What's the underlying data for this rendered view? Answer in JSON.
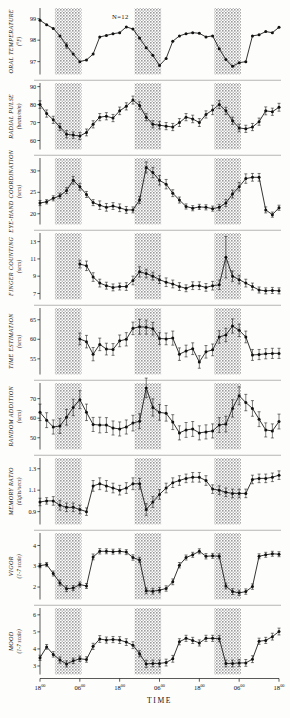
{
  "figure": {
    "annotation": "N=12",
    "x_axis_title": "TIME",
    "x_tick_labels": [
      "18",
      "06",
      "18",
      "06",
      "18",
      "06",
      "18"
    ],
    "x_tick_sup": "00",
    "x_tick_hours": [
      18,
      30,
      42,
      54,
      66,
      78,
      90
    ],
    "shaded_label": "sleep period",
    "shaded_color": "#c9c9c9",
    "line_color": "#111111"
  },
  "chart_data": [
    {
      "type": "line",
      "panel": 1,
      "title": "ORAL TEMPERATURE",
      "ylabel": "ORAL TEMPERATURE",
      "yunit": "(°F)",
      "xlabel": "TIME",
      "ylim": [
        96.4,
        99.5
      ],
      "yticks": [
        97,
        98,
        99
      ],
      "ytick_labels": [
        "97",
        "98",
        "99"
      ],
      "grid": false,
      "x": [
        18,
        20,
        22,
        24,
        26,
        28,
        30,
        32,
        34,
        36,
        38,
        40,
        42,
        44,
        46,
        48,
        50,
        52,
        54,
        56,
        58,
        60,
        62,
        64,
        66,
        68,
        70,
        72,
        74,
        76,
        78,
        80,
        82,
        84,
        86,
        88,
        90
      ],
      "values": [
        98.93,
        98.72,
        98.55,
        98.2,
        97.75,
        97.35,
        97.0,
        97.08,
        97.35,
        98.15,
        98.22,
        98.3,
        98.35,
        98.62,
        98.52,
        98.1,
        97.65,
        97.3,
        96.82,
        97.15,
        97.95,
        98.2,
        98.3,
        98.35,
        98.32,
        98.15,
        98.2,
        97.6,
        97.1,
        96.78,
        96.95,
        97.0,
        98.2,
        98.25,
        98.4,
        98.35,
        98.6
      ],
      "errors": [
        0,
        0,
        0,
        0,
        0.12,
        0,
        0,
        0,
        0,
        0,
        0,
        0,
        0,
        0,
        0,
        0,
        0,
        0,
        0,
        0,
        0,
        0,
        0,
        0,
        0,
        0,
        0,
        0,
        0,
        0,
        0,
        0,
        0,
        0,
        0,
        0,
        0
      ]
    },
    {
      "type": "line",
      "panel": 2,
      "title": "RADIAL PULSE",
      "ylabel": "RADIAL PULSE",
      "yunit": "(beats/min)",
      "xlabel": "TIME",
      "ylim": [
        55,
        92
      ],
      "yticks": [
        60,
        70,
        80,
        90
      ],
      "ytick_labels": [
        "60",
        "70",
        "80",
        "90"
      ],
      "grid": false,
      "x": [
        18,
        20,
        22,
        24,
        26,
        28,
        30,
        32,
        34,
        36,
        38,
        40,
        42,
        44,
        46,
        48,
        50,
        52,
        54,
        56,
        58,
        60,
        62,
        64,
        66,
        68,
        70,
        72,
        74,
        76,
        78,
        80,
        82,
        84,
        86,
        88,
        90
      ],
      "values": [
        80.0,
        75.0,
        71.5,
        67.5,
        63.5,
        63.0,
        62.5,
        64.5,
        69.0,
        73.0,
        73.5,
        72.5,
        76.5,
        79.0,
        82.5,
        79.5,
        73.0,
        69.0,
        68.5,
        68.0,
        67.5,
        70.0,
        73.0,
        72.0,
        70.0,
        74.5,
        77.0,
        80.0,
        76.5,
        71.0,
        67.0,
        66.5,
        67.5,
        70.5,
        76.5,
        76.0,
        78.5
      ],
      "errors": [
        2.1,
        2.0,
        2.0,
        2.0,
        2.0,
        1.8,
        2.0,
        1.9,
        2.0,
        2.0,
        2.0,
        2.0,
        2.1,
        2.0,
        2.2,
        2.1,
        2.0,
        2.0,
        2.0,
        2.0,
        2.0,
        2.2,
        2.0,
        2.1,
        2.2,
        2.0,
        2.6,
        2.2,
        2.0,
        2.0,
        2.1,
        2.0,
        2.0,
        2.0,
        2.2,
        2.0,
        2.2
      ]
    },
    {
      "type": "line",
      "panel": 3,
      "title": "EYE-HAND COORDINATION",
      "ylabel": "EYE-HAND COORDINATION",
      "yunit": "(secs)",
      "xlabel": "TIME",
      "ylim": [
        17.5,
        33
      ],
      "yticks": [
        20,
        25,
        30
      ],
      "ytick_labels": [
        "20",
        "25",
        "30"
      ],
      "grid": false,
      "x": [
        18,
        20,
        22,
        24,
        26,
        28,
        30,
        32,
        34,
        36,
        38,
        40,
        42,
        44,
        46,
        48,
        50,
        52,
        54,
        56,
        58,
        60,
        62,
        64,
        66,
        68,
        70,
        72,
        74,
        76,
        78,
        80,
        82,
        84,
        86,
        88,
        90
      ],
      "values": [
        22.5,
        22.8,
        23.6,
        24.2,
        25.4,
        27.8,
        26.3,
        24.5,
        22.6,
        22.0,
        21.5,
        21.8,
        21.4,
        20.9,
        20.9,
        23.2,
        30.8,
        29.6,
        27.8,
        26.9,
        24.8,
        23.2,
        21.7,
        21.3,
        21.6,
        21.5,
        21.2,
        21.5,
        22.5,
        24.6,
        26.3,
        28.2,
        28.5,
        28.5,
        20.9,
        19.8,
        21.4
      ],
      "errors": [
        0.6,
        0.5,
        0.6,
        0.6,
        0.7,
        0.9,
        0.8,
        0.7,
        0.7,
        1.0,
        0.9,
        0.8,
        0.9,
        0.8,
        0.7,
        0.8,
        1.3,
        1.2,
        1.1,
        1.1,
        0.8,
        0.7,
        0.6,
        0.6,
        0.6,
        0.6,
        0.6,
        0.7,
        0.8,
        0.9,
        1.0,
        1.1,
        0.9,
        0.9,
        0.7,
        0.6,
        0.6
      ]
    },
    {
      "type": "line",
      "panel": 4,
      "title": "FINGER COUNTING",
      "ylabel": "FINGER COUNTING",
      "yunit": "(secs)",
      "xlabel": "TIME",
      "ylim": [
        6.3,
        14
      ],
      "yticks": [
        7,
        9,
        11,
        13
      ],
      "ytick_labels": [
        "7",
        "9",
        "11",
        "13"
      ],
      "grid": false,
      "x": [
        30,
        32,
        34,
        36,
        38,
        40,
        42,
        44,
        46,
        48,
        50,
        52,
        54,
        56,
        58,
        60,
        62,
        64,
        66,
        68,
        70,
        72,
        74,
        76,
        78,
        80,
        82,
        84,
        86,
        88,
        90
      ],
      "values": [
        10.4,
        10.2,
        8.9,
        8.2,
        7.9,
        7.7,
        7.8,
        7.8,
        8.5,
        9.5,
        9.3,
        9.0,
        8.6,
        8.3,
        8.1,
        7.8,
        7.6,
        7.9,
        7.9,
        7.7,
        7.9,
        8.0,
        11.2,
        9.0,
        8.6,
        8.2,
        7.8,
        7.4,
        7.3,
        7.35,
        7.3
      ],
      "errors": [
        0.45,
        0.55,
        0.5,
        0.45,
        0.4,
        0.4,
        0.4,
        0.45,
        0.5,
        0.6,
        0.5,
        0.45,
        0.45,
        0.5,
        0.45,
        0.45,
        0.4,
        0.45,
        0.45,
        0.45,
        0.5,
        0.55,
        2.4,
        0.6,
        0.5,
        0.45,
        0.4,
        0.35,
        0.35,
        0.35,
        0.35
      ]
    },
    {
      "type": "line",
      "panel": 5,
      "title": "TIME ESTIMATION",
      "ylabel": "TIME ESTIMATION",
      "yunit": "(secs)",
      "xlabel": "TIME",
      "ylim": [
        51,
        68
      ],
      "yticks": [
        55,
        60,
        65
      ],
      "ytick_labels": [
        "55",
        "60",
        "65"
      ],
      "grid": false,
      "x": [
        30,
        32,
        34,
        36,
        38,
        40,
        42,
        44,
        46,
        48,
        50,
        52,
        54,
        56,
        58,
        60,
        62,
        64,
        66,
        68,
        70,
        72,
        74,
        76,
        78,
        80,
        82,
        84,
        86,
        88,
        90
      ],
      "values": [
        60.1,
        59.4,
        56.2,
        58.7,
        57.5,
        57.4,
        59.6,
        60.0,
        62.8,
        63.2,
        63.1,
        62.7,
        60.2,
        60.1,
        60.3,
        56.2,
        57.0,
        57.6,
        54.2,
        56.8,
        57.3,
        60.6,
        61.1,
        63.4,
        62.3,
        60.6,
        56.0,
        56.1,
        56.3,
        56.4,
        56.4
      ],
      "errors": [
        1.5,
        1.6,
        1.7,
        1.6,
        1.5,
        1.5,
        1.5,
        1.7,
        1.6,
        1.9,
        1.8,
        1.6,
        1.5,
        1.5,
        1.8,
        1.6,
        1.5,
        1.5,
        1.6,
        1.6,
        1.5,
        1.6,
        1.7,
        1.8,
        1.6,
        1.5,
        1.4,
        1.3,
        1.3,
        1.3,
        1.3
      ]
    },
    {
      "type": "line",
      "panel": 6,
      "title": "RANDOM ADDITION",
      "ylabel": "RANDOM ADDITION",
      "yunit": "(secs)",
      "xlabel": "TIME",
      "ylim": [
        44,
        78
      ],
      "yticks": [
        50,
        60,
        70
      ],
      "ytick_labels": [
        "50",
        "60",
        "70"
      ],
      "grid": false,
      "x": [
        18,
        20,
        22,
        24,
        26,
        28,
        30,
        32,
        34,
        36,
        38,
        40,
        42,
        44,
        46,
        48,
        50,
        52,
        54,
        56,
        58,
        60,
        62,
        64,
        66,
        68,
        70,
        72,
        74,
        76,
        78,
        80,
        82,
        84,
        86,
        88,
        90
      ],
      "values": [
        63.0,
        59.0,
        55.5,
        56.0,
        60.5,
        65.5,
        69.5,
        63.0,
        56.8,
        56.5,
        56.5,
        55.0,
        54.5,
        55.5,
        57.5,
        58.5,
        75.5,
        65.5,
        63.0,
        62.5,
        58.0,
        52.5,
        54.0,
        54.5,
        52.5,
        53.0,
        53.5,
        56.5,
        57.0,
        65.0,
        71.5,
        68.0,
        65.0,
        59.5,
        54.0,
        53.5,
        58.3
      ],
      "errors": [
        4.2,
        3.8,
        3.6,
        3.8,
        4.0,
        4.2,
        4.6,
        4.2,
        3.6,
        4.0,
        3.8,
        3.6,
        3.6,
        3.6,
        4.0,
        3.8,
        5.0,
        4.4,
        4.0,
        4.0,
        3.8,
        3.6,
        3.8,
        3.8,
        3.6,
        3.6,
        3.6,
        3.8,
        4.0,
        4.4,
        4.6,
        4.2,
        4.0,
        3.8,
        3.6,
        3.6,
        3.8
      ]
    },
    {
      "type": "line",
      "panel": 7,
      "title": "MEMORY RATIO",
      "ylabel": "MEMORY RATIO",
      "yunit": "(digits/secs)",
      "xlabel": "TIME",
      "ylim": [
        0.78,
        1.4
      ],
      "yticks": [
        0.9,
        1.1,
        1.3
      ],
      "ytick_labels": [
        "0.9",
        "1.1",
        "1.3"
      ],
      "grid": false,
      "x": [
        18,
        20,
        22,
        24,
        26,
        28,
        30,
        32,
        34,
        36,
        38,
        40,
        42,
        44,
        46,
        48,
        50,
        52,
        54,
        56,
        58,
        60,
        62,
        64,
        66,
        68,
        70,
        72,
        74,
        76,
        78,
        80,
        82,
        84,
        86,
        88,
        90
      ],
      "values": [
        0.99,
        1.0,
        1.0,
        0.96,
        0.94,
        0.94,
        0.92,
        0.9,
        1.14,
        1.16,
        1.14,
        1.12,
        1.1,
        1.12,
        1.16,
        1.16,
        0.92,
        0.99,
        1.06,
        1.12,
        1.17,
        1.19,
        1.21,
        1.22,
        1.22,
        1.19,
        1.11,
        1.1,
        1.08,
        1.07,
        1.07,
        1.07,
        1.2,
        1.21,
        1.21,
        1.22,
        1.24
      ],
      "errors": [
        0.035,
        0.03,
        0.04,
        0.045,
        0.04,
        0.04,
        0.04,
        0.035,
        0.05,
        0.055,
        0.05,
        0.045,
        0.045,
        0.05,
        0.055,
        0.05,
        0.055,
        0.05,
        0.045,
        0.045,
        0.045,
        0.045,
        0.04,
        0.045,
        0.045,
        0.045,
        0.04,
        0.04,
        0.04,
        0.04,
        0.04,
        0.04,
        0.04,
        0.04,
        0.04,
        0.04,
        0.04
      ]
    },
    {
      "type": "line",
      "panel": 8,
      "title": "VIGOR",
      "ylabel": "VIGOR",
      "yunit": "(1-7 scale)",
      "xlabel": "TIME",
      "ylim": [
        1.4,
        4.6
      ],
      "yticks": [
        2,
        3,
        4
      ],
      "ytick_labels": [
        "2",
        "3",
        "4"
      ],
      "grid": false,
      "x": [
        18,
        20,
        22,
        24,
        26,
        28,
        30,
        32,
        34,
        36,
        38,
        40,
        42,
        44,
        46,
        48,
        50,
        52,
        54,
        56,
        58,
        60,
        62,
        64,
        66,
        68,
        70,
        72,
        74,
        76,
        78,
        80,
        82,
        84,
        86,
        88,
        90
      ],
      "values": [
        3.03,
        3.08,
        2.65,
        2.2,
        1.92,
        1.95,
        2.12,
        2.05,
        3.45,
        3.72,
        3.72,
        3.7,
        3.72,
        3.68,
        3.42,
        3.3,
        1.82,
        1.8,
        1.85,
        1.93,
        2.25,
        3.05,
        3.42,
        3.55,
        3.72,
        3.48,
        3.5,
        3.48,
        2.05,
        1.78,
        1.72,
        1.78,
        2.02,
        3.48,
        3.55,
        3.6,
        3.58
      ],
      "errors": [
        0.1,
        0.1,
        0.12,
        0.14,
        0.14,
        0.12,
        0.12,
        0.12,
        0.14,
        0.13,
        0.12,
        0.12,
        0.12,
        0.12,
        0.13,
        0.13,
        0.14,
        0.14,
        0.13,
        0.13,
        0.14,
        0.13,
        0.12,
        0.12,
        0.12,
        0.13,
        0.12,
        0.12,
        0.14,
        0.14,
        0.13,
        0.13,
        0.13,
        0.12,
        0.12,
        0.12,
        0.12
      ]
    },
    {
      "type": "line",
      "panel": 9,
      "title": "MOOD",
      "ylabel": "MOOD",
      "yunit": "(1-7 scale)",
      "xlabel": "TIME",
      "ylim": [
        2.5,
        6.4
      ],
      "yticks": [
        3,
        4,
        5,
        6
      ],
      "ytick_labels": [
        "3",
        "4",
        "5",
        "6"
      ],
      "grid": false,
      "x": [
        18,
        20,
        22,
        24,
        26,
        28,
        30,
        32,
        34,
        36,
        38,
        40,
        42,
        44,
        46,
        48,
        50,
        52,
        54,
        56,
        58,
        60,
        62,
        64,
        66,
        68,
        70,
        72,
        74,
        76,
        78,
        80,
        82,
        84,
        86,
        88,
        90
      ],
      "values": [
        3.48,
        4.12,
        3.68,
        3.35,
        3.12,
        3.3,
        3.42,
        3.38,
        4.15,
        4.58,
        4.52,
        4.55,
        4.52,
        4.4,
        4.22,
        3.72,
        3.12,
        3.15,
        3.15,
        3.2,
        3.42,
        4.42,
        4.62,
        4.5,
        4.35,
        4.62,
        4.62,
        4.6,
        3.15,
        3.15,
        3.18,
        3.18,
        3.4,
        4.45,
        4.5,
        4.72,
        5.02
      ],
      "errors": [
        0.15,
        0.14,
        0.16,
        0.18,
        0.18,
        0.16,
        0.16,
        0.16,
        0.18,
        0.2,
        0.18,
        0.18,
        0.2,
        0.2,
        0.2,
        0.18,
        0.22,
        0.2,
        0.2,
        0.2,
        0.2,
        0.18,
        0.18,
        0.18,
        0.18,
        0.18,
        0.18,
        0.18,
        0.2,
        0.2,
        0.2,
        0.2,
        0.2,
        0.18,
        0.18,
        0.2,
        0.2
      ]
    }
  ],
  "shaded_periods": [
    {
      "start": 22.5,
      "end": 30.5
    },
    {
      "start": 46.5,
      "end": 54.5
    },
    {
      "start": 70.5,
      "end": 78.5
    }
  ]
}
